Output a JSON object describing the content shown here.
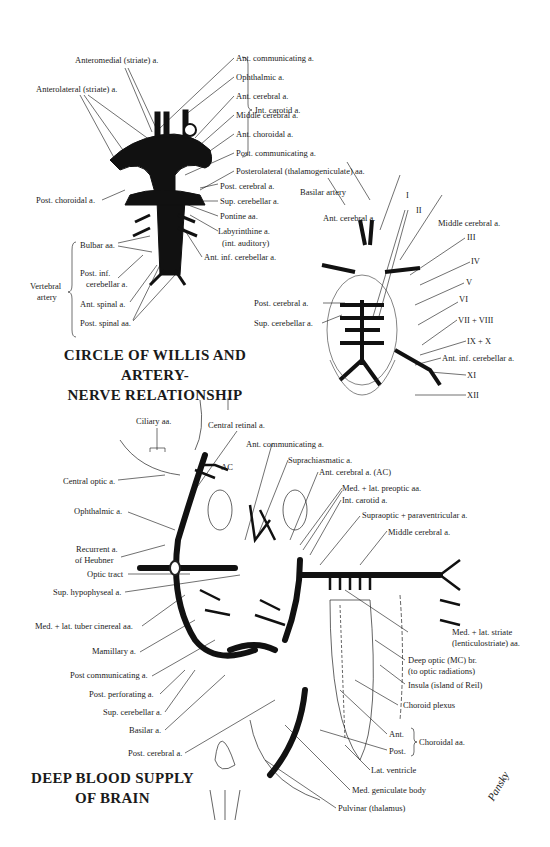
{
  "figure1": {
    "title_line1": "CIRCLE OF WILLIS AND ARTERY-",
    "title_line2": "NERVE RELATIONSHIP",
    "labels": {
      "anteromedial": "Anteromedial (striate) a.",
      "anterolateral": "Anterolateral (striate) a.",
      "ant_communicating": "Ant. communicating a.",
      "ophthalmic": "Ophthalmic a.",
      "ant_cerebral": "Ant. cerebral a.",
      "middle_cerebral": "Middle cerebral a.",
      "ant_choroidal": "Ant. choroidal a.",
      "post_communicating": "Post. communicating a.",
      "int_carotid": "Int. carotid a.",
      "posterolateral": "Posterolateral (thalamogeniculate) aa.",
      "post_choroidal": "Post. choroidal a.",
      "post_cerebral": "Post. cerebral a.",
      "sup_cerebellar": "Sup. cerebellar a.",
      "pontine": "Pontine aa.",
      "labyrinthine_1": "Labyrinthine a.",
      "labyrinthine_2": "(int. auditory)",
      "ant_inf_cerebellar": "Ant. inf. cerebellar a.",
      "bulbar": "Bulbar aa.",
      "post_inf_cerebellar_1": "Post. inf.",
      "post_inf_cerebellar_2": "cerebellar a.",
      "ant_spinal": "Ant. spinal a.",
      "post_spinal": "Post. spinal aa.",
      "vertebral_1": "Vertebral",
      "vertebral_2": "artery"
    }
  },
  "figure2": {
    "labels": {
      "basilar_artery": "Basilar artery",
      "ant_cerebral": "Ant. cerebral a.",
      "middle_cerebral": "Middle cerebral a.",
      "post_cerebral": "Post. cerebral a.",
      "sup_cerebellar": "Sup. cerebellar a.",
      "ant_inf_cerebellar": "Ant. inf. cerebellar a.",
      "nerve_I": "I",
      "nerve_II": "II",
      "nerve_III": "III",
      "nerve_IV": "IV",
      "nerve_V": "V",
      "nerve_VI": "VI",
      "nerve_VII_VIII": "VII + VIII",
      "nerve_IX_X": "IX + X",
      "nerve_XI": "XI",
      "nerve_XII": "XII"
    }
  },
  "figure3": {
    "title_line1": "DEEP BLOOD SUPPLY",
    "title_line2": "OF BRAIN",
    "labels": {
      "ciliary": "Ciliary aa.",
      "central_retinal": "Central retinal a.",
      "ant_communicating": "Ant. communicating a.",
      "suprachiasmatic": "Suprachiasmatic a.",
      "ac": "AC",
      "ant_cerebral_ac": "Ant. cerebral a. (AC)",
      "med_lat_preoptic": "Med. + lat. preoptic aa.",
      "int_carotid": "Int. carotid a.",
      "supraoptic": "Supraoptic + paraventricular a.",
      "middle_cerebral": "Middle cerebral a.",
      "central_optic": "Central optic a.",
      "ophthalmic": "Ophthalmic a.",
      "recurrent_1": "Recurrent a.",
      "recurrent_2": "of Heubner",
      "optic_tract": "Optic tract",
      "sup_hypophyseal": "Sup. hypophyseal a.",
      "tuber_cinereal": "Med. + lat. tuber cinereal aa.",
      "mamillary": "Mamillary a.",
      "post_communicating": "Post communicating a.",
      "post_perforating": "Post. perforating a.",
      "sup_cerebellar": "Sup. cerebellar a.",
      "basilar": "Basilar a.",
      "post_cerebral": "Post. cerebral a.",
      "striate_1": "Med. + lat. striate",
      "striate_2": "(lenticulostriate) aa.",
      "deep_optic_1": "Deep optic (MC) br.",
      "deep_optic_2": "(to optic radiations)",
      "insula": "Insula (island of Reil)",
      "choroid_plexus": "Choroid plexus",
      "ant": "Ant.",
      "post": "Post.",
      "choroidal_aa": "Choroidal aa.",
      "lat_ventricle": "Lat. ventricle",
      "med_geniculate": "Med. geniculate body",
      "pulvinar": "Pulvinar (thalamus)"
    }
  },
  "signature": "Pansky"
}
